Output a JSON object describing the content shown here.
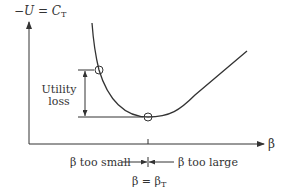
{
  "diagram": {
    "y_axis_label": "−U = C",
    "y_axis_label_sub": "T",
    "x_axis_label": "β",
    "bracket_label_line1": "Utility",
    "bracket_label_line2": "loss",
    "left_annotation": "β too small",
    "right_annotation": "β too large",
    "optimum_label": "β = β",
    "optimum_label_sub": "T",
    "colors": {
      "line": "#333333",
      "text": "#333333",
      "background": "#ffffff"
    },
    "markers": [
      {
        "name": "suboptimal-point",
        "desc": "point on curve at beta too small"
      },
      {
        "name": "optimum-point",
        "desc": "curve minimum at beta = beta_T"
      }
    ]
  }
}
